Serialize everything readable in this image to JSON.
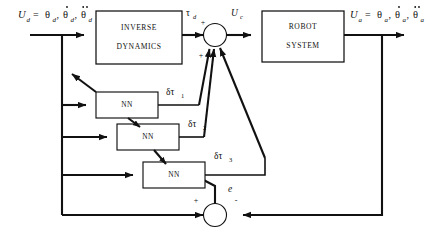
{
  "diagram": {
    "background_color": "#ffffff",
    "line_color": "#111111",
    "blocks": [
      {
        "id": "inverse_dynamics",
        "line1": "INVERSE",
        "line2": "DYNAMICS"
      },
      {
        "id": "robot_system",
        "line1": "ROBOT",
        "line2": "SYSTEM"
      },
      {
        "id": "nn1",
        "label": "NN"
      },
      {
        "id": "nn2",
        "label": "NN"
      },
      {
        "id": "nn3",
        "label": "NN"
      }
    ],
    "signals": {
      "input_desired": "Ud = θd, θ̇d, θ̈d",
      "input_desired_parts": {
        "name": "U",
        "name_sub": "d",
        "eq": "=",
        "terms": [
          {
            "base": "θ",
            "sub": "d",
            "dots": 0
          },
          {
            "base": "θ",
            "sub": "d",
            "dots": 1
          },
          {
            "base": "θ",
            "sub": "d",
            "dots": 2
          }
        ]
      },
      "output_actual_parts": {
        "name": "U",
        "name_sub": "a",
        "eq": "=",
        "terms": [
          {
            "base": "θ",
            "sub": "a",
            "dots": 0
          },
          {
            "base": "θ",
            "sub": "a",
            "dots": 1
          },
          {
            "base": "θ",
            "sub": "a",
            "dots": 2
          }
        ]
      },
      "tau_d": {
        "base": "τ",
        "sub": "d"
      },
      "u_c": {
        "base": "U",
        "sub": "c"
      },
      "dtau1": {
        "base": "δτ",
        "sub": "1"
      },
      "dtau2": {
        "base": "δτ",
        "sub": "2"
      },
      "dtau3": {
        "base": "δτ",
        "sub": "3"
      },
      "error": {
        "base": "e",
        "sub": ""
      }
    },
    "junctions": [
      {
        "id": "sum_top",
        "signs": [
          "+",
          "+"
        ],
        "inputs": [
          "tau_d",
          "dtau1",
          "dtau2",
          "dtau3"
        ],
        "output": "u_c"
      },
      {
        "id": "sum_bottom",
        "signs": [
          "+",
          "-"
        ],
        "inputs": [
          "U_d",
          "U_a"
        ],
        "output": "e"
      }
    ],
    "signs": {
      "plus": "+",
      "minus": "-"
    }
  }
}
